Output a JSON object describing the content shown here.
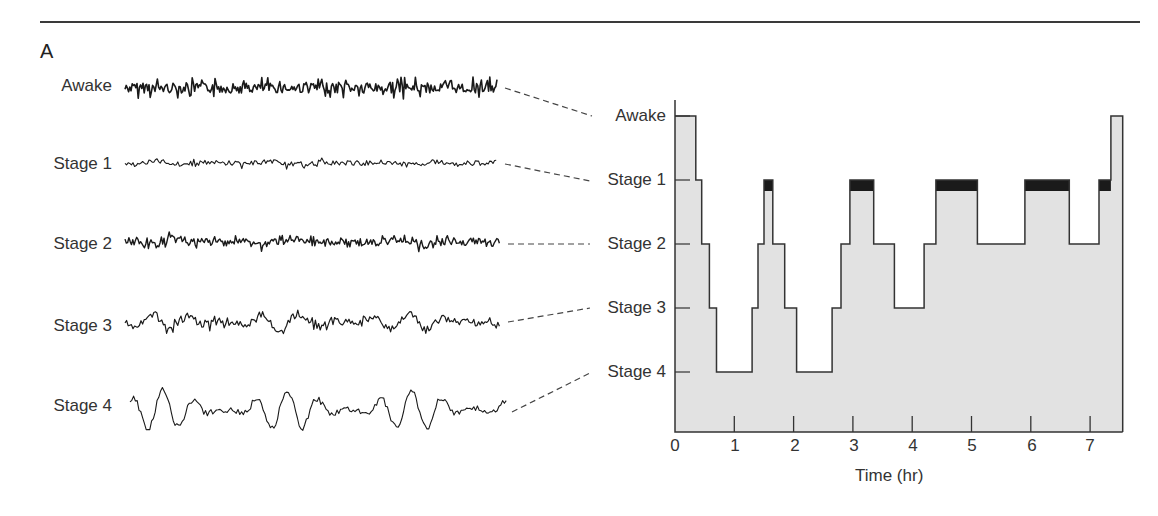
{
  "figure": {
    "panel_label": "A",
    "eeg_traces": [
      {
        "label": "Awake"
      },
      {
        "label": "Stage 1"
      },
      {
        "label": "Stage 2"
      },
      {
        "label": "Stage 3"
      },
      {
        "label": "Stage 4"
      }
    ]
  },
  "chart_data": {
    "type": "area",
    "title": "",
    "xlabel": "Time (hr)",
    "ylabel": "",
    "x_ticks": [
      "0",
      "1",
      "2",
      "3",
      "4",
      "5",
      "6",
      "7"
    ],
    "xlim": [
      0,
      7.6
    ],
    "y_categories": [
      "Awake",
      "Stage 1",
      "Stage 2",
      "Stage 3",
      "Stage 4"
    ],
    "annotation": "Black bars at Stage 1 indicate REM sleep episodes",
    "hypnogram_segments": [
      {
        "start": 0.0,
        "end": 0.35,
        "stage": "Awake"
      },
      {
        "start": 0.35,
        "end": 0.45,
        "stage": "Stage 1"
      },
      {
        "start": 0.45,
        "end": 0.58,
        "stage": "Stage 2"
      },
      {
        "start": 0.58,
        "end": 0.7,
        "stage": "Stage 3"
      },
      {
        "start": 0.7,
        "end": 1.3,
        "stage": "Stage 4"
      },
      {
        "start": 1.3,
        "end": 1.4,
        "stage": "Stage 3"
      },
      {
        "start": 1.4,
        "end": 1.5,
        "stage": "Stage 2"
      },
      {
        "start": 1.5,
        "end": 1.65,
        "stage": "Stage 1",
        "rem": true
      },
      {
        "start": 1.65,
        "end": 1.85,
        "stage": "Stage 2"
      },
      {
        "start": 1.85,
        "end": 2.05,
        "stage": "Stage 3"
      },
      {
        "start": 2.05,
        "end": 2.65,
        "stage": "Stage 4"
      },
      {
        "start": 2.65,
        "end": 2.8,
        "stage": "Stage 3"
      },
      {
        "start": 2.8,
        "end": 2.95,
        "stage": "Stage 2"
      },
      {
        "start": 2.95,
        "end": 3.35,
        "stage": "Stage 1",
        "rem": true
      },
      {
        "start": 3.35,
        "end": 3.7,
        "stage": "Stage 2"
      },
      {
        "start": 3.7,
        "end": 4.2,
        "stage": "Stage 3"
      },
      {
        "start": 4.2,
        "end": 4.4,
        "stage": "Stage 2"
      },
      {
        "start": 4.4,
        "end": 5.1,
        "stage": "Stage 1",
        "rem": true
      },
      {
        "start": 5.1,
        "end": 5.9,
        "stage": "Stage 2"
      },
      {
        "start": 5.9,
        "end": 6.65,
        "stage": "Stage 1",
        "rem": true
      },
      {
        "start": 6.65,
        "end": 7.15,
        "stage": "Stage 2"
      },
      {
        "start": 7.15,
        "end": 7.35,
        "stage": "Stage 1",
        "rem": true
      },
      {
        "start": 7.35,
        "end": 7.55,
        "stage": "Awake"
      }
    ]
  }
}
